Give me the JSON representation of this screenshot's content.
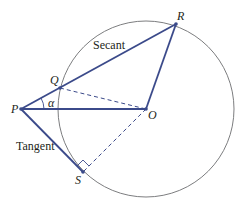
{
  "diagram": {
    "type": "geometry",
    "colors": {
      "circle": "#6d6e71",
      "segments": "#3b4a8a",
      "text": "#231f20"
    },
    "circle": {
      "center": "O",
      "cx": 146,
      "cy": 109,
      "r": 88
    },
    "points": {
      "P": {
        "label": "P",
        "x": 21,
        "y": 109
      },
      "Q": {
        "label": "Q",
        "x": 60,
        "y": 88
      },
      "R": {
        "label": "R",
        "x": 176,
        "y": 24
      },
      "O": {
        "label": "O",
        "x": 146,
        "y": 109
      },
      "S": {
        "label": "S",
        "x": 83,
        "y": 172
      }
    },
    "labels": {
      "secant": "Secant",
      "tangent": "Tangent",
      "angle": "α"
    },
    "segments": [
      {
        "from": "P",
        "to": "R",
        "style": "solid",
        "name": "secant"
      },
      {
        "from": "P",
        "to": "O",
        "style": "solid"
      },
      {
        "from": "O",
        "to": "R",
        "style": "solid"
      },
      {
        "from": "P",
        "to": "S",
        "style": "solid",
        "name": "tangent"
      },
      {
        "from": "Q",
        "to": "O",
        "style": "dashed"
      },
      {
        "from": "O",
        "to": "S",
        "style": "dashed"
      }
    ],
    "annotations": {
      "angle_at_P": "α",
      "right_angle_at_S": true
    }
  }
}
